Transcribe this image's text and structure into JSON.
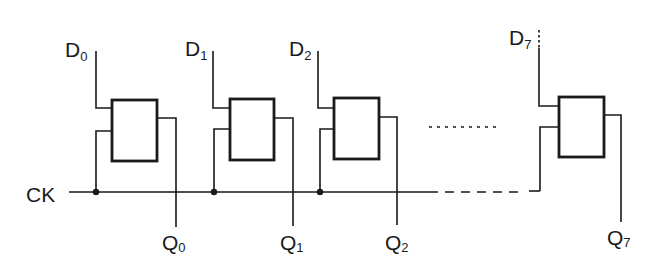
{
  "diagram": {
    "clock_label": "CK",
    "ellipsis_between": [
      "stage-2",
      "stage-7"
    ],
    "stages": [
      {
        "id": 0,
        "input": {
          "letter": "D",
          "index": "0"
        },
        "output": {
          "letter": "Q",
          "index": "0"
        }
      },
      {
        "id": 1,
        "input": {
          "letter": "D",
          "index": "1"
        },
        "output": {
          "letter": "Q",
          "index": "1"
        }
      },
      {
        "id": 2,
        "input": {
          "letter": "D",
          "index": "2"
        },
        "output": {
          "letter": "Q",
          "index": "2"
        }
      },
      {
        "id": 7,
        "input": {
          "letter": "D",
          "index": "7"
        },
        "output": {
          "letter": "Q",
          "index": "7"
        }
      }
    ]
  }
}
